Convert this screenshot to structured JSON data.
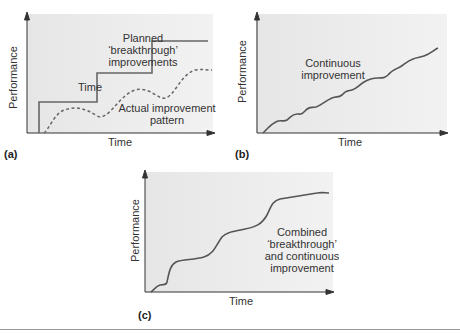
{
  "panels": {
    "a": {
      "tag": "(a)",
      "ylabel": "Performance",
      "xlabel": "Time",
      "annotations": {
        "planned_line1": "Planned",
        "planned_line2": "‘breakthrough’",
        "planned_line3": "improvements",
        "actual_line1": "Actual improvement",
        "actual_line2": "pattern"
      }
    },
    "b": {
      "tag": "(b)",
      "ylabel": "Performance",
      "xlabel": "Time",
      "annotations": {
        "line1": "Continuous",
        "line2": "improvement"
      }
    },
    "c": {
      "tag": "(c)",
      "ylabel": "Performance",
      "xlabel": "Time",
      "annotations": {
        "line1": "Combined",
        "line2": "‘breakthrough’",
        "line3": "and continuous",
        "line4": "improvement"
      }
    }
  },
  "colors": {
    "plot_bg": "#ececec",
    "line": "#555555",
    "axis": "#333333"
  }
}
